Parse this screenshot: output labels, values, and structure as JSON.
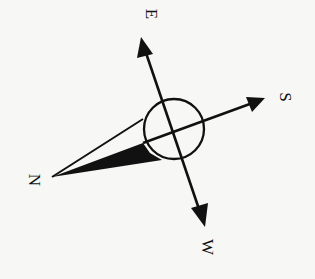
{
  "diagram": {
    "type": "compass-rose",
    "labels": {
      "north": "N",
      "east": "E",
      "south": "S",
      "west": "W"
    },
    "colors": {
      "ink": "#111111",
      "background": "#f7f7f5"
    }
  }
}
